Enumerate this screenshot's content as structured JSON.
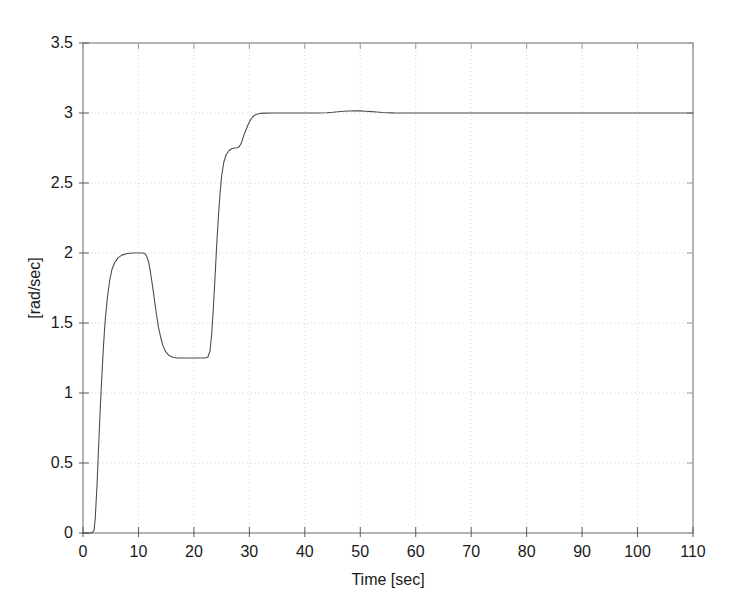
{
  "chart_data": {
    "type": "line",
    "title": "",
    "xlabel": "Time [sec]",
    "ylabel": "[rad/sec]",
    "xlim": [
      0,
      110
    ],
    "ylim": [
      0,
      3.5
    ],
    "xticks": [
      0,
      10,
      20,
      30,
      40,
      50,
      60,
      70,
      80,
      90,
      100,
      110
    ],
    "xtick_labels": [
      "0",
      "10",
      "20",
      "30",
      "40",
      "50",
      "60",
      "70",
      "80",
      "90",
      "100",
      "110"
    ],
    "yticks": [
      0,
      0.5,
      1,
      1.5,
      2,
      2.5,
      3,
      3.5
    ],
    "ytick_labels": [
      "0",
      "0.5",
      "1",
      "1.5",
      "2",
      "2.5",
      "3",
      "3.5"
    ],
    "grid": true,
    "grid_style": "dotted",
    "grid_color": "#d8d8d8",
    "legend": null,
    "line_color": "#4d4d4d",
    "line_width": 1.1,
    "series": [
      {
        "name": "angular velocity response",
        "description": "Staircase reference tracking: step to 2 rad/sec, down to 1.25 rad/sec, up through 2.75 rad/sec intermediate plateau to final 3 rad/sec with slight overshoot near t=50",
        "x": [
          0,
          1.0,
          1.6,
          2.0,
          2.2,
          2.5,
          2.8,
          3.1,
          3.4,
          3.7,
          4.0,
          4.4,
          4.8,
          5.2,
          5.7,
          6.3,
          7.0,
          8.0,
          9.0,
          10.0,
          10.8,
          11.2,
          11.5,
          11.8,
          12.1,
          12.4,
          12.7,
          13.0,
          13.3,
          13.6,
          14.0,
          14.4,
          14.9,
          15.5,
          16.2,
          17.0,
          18.0,
          19.0,
          20.0,
          21.0,
          22.0,
          22.5,
          22.9,
          23.2,
          23.5,
          23.8,
          24.1,
          24.4,
          24.7,
          25.0,
          25.4,
          25.8,
          26.3,
          26.8,
          27.3,
          27.8,
          28.2,
          28.6,
          29.0,
          29.4,
          29.8,
          30.2,
          30.6,
          31.0,
          31.5,
          32.0,
          33.0,
          34.0,
          36.0,
          38.0,
          40.0,
          42.0,
          44.0,
          45.0,
          46.0,
          47.0,
          48.0,
          49.0,
          50.0,
          51.0,
          52.0,
          53.0,
          54.0,
          56.0,
          58.0,
          60.0,
          65.0,
          70.0,
          75.0,
          80.0,
          85.0,
          90.0,
          95.0,
          100.0,
          105.0,
          110.0
        ],
        "y": [
          0,
          0,
          0,
          0.02,
          0.1,
          0.32,
          0.6,
          0.88,
          1.12,
          1.34,
          1.52,
          1.68,
          1.8,
          1.88,
          1.93,
          1.965,
          1.985,
          1.996,
          2.0,
          2.0,
          2.0,
          1.995,
          1.975,
          1.94,
          1.88,
          1.8,
          1.72,
          1.63,
          1.55,
          1.47,
          1.4,
          1.34,
          1.295,
          1.268,
          1.255,
          1.25,
          1.25,
          1.25,
          1.25,
          1.25,
          1.25,
          1.255,
          1.3,
          1.42,
          1.6,
          1.82,
          2.05,
          2.25,
          2.42,
          2.55,
          2.65,
          2.7,
          2.73,
          2.745,
          2.75,
          2.752,
          2.76,
          2.79,
          2.84,
          2.88,
          2.92,
          2.95,
          2.973,
          2.985,
          2.993,
          2.997,
          2.999,
          3.0,
          3.0,
          3.0,
          3.0,
          3.0,
          3.002,
          3.005,
          3.009,
          3.012,
          3.014,
          3.015,
          3.015,
          3.013,
          3.01,
          3.007,
          3.004,
          3.001,
          3.0,
          3.0,
          3.0,
          3.0,
          3.0,
          3.0,
          3.0,
          3.0,
          3.0,
          3.0,
          3.0,
          3.0
        ]
      }
    ]
  },
  "plot_geometry": {
    "left_px": 83,
    "right_px": 693,
    "top_px": 43,
    "bottom_px": 533
  }
}
